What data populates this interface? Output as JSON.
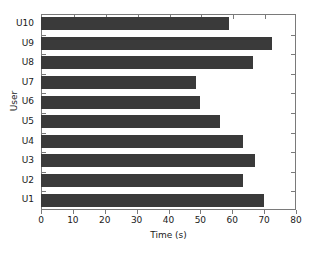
{
  "chart_data": {
    "type": "bar",
    "orientation": "horizontal",
    "title": "",
    "xlabel": "Time (s)",
    "ylabel": "User",
    "categories": [
      "U1",
      "U2",
      "U3",
      "U4",
      "U5",
      "U6",
      "U7",
      "U8",
      "U9",
      "U10"
    ],
    "values": [
      70,
      63.5,
      67,
      63.5,
      56,
      50,
      48.7,
      66.5,
      72.5,
      59
    ],
    "xlim": [
      0,
      80
    ],
    "xticks": [
      0,
      10,
      20,
      30,
      40,
      50,
      60,
      70,
      80
    ],
    "xtick_labels": [
      "0",
      "10",
      "20",
      "30",
      "40",
      "50",
      "60",
      "70",
      "80"
    ],
    "grid": false,
    "legend": null,
    "bar_color": "#3a3a3a",
    "axis_color": "#7a7a7a",
    "background_color": "#ffffff"
  }
}
